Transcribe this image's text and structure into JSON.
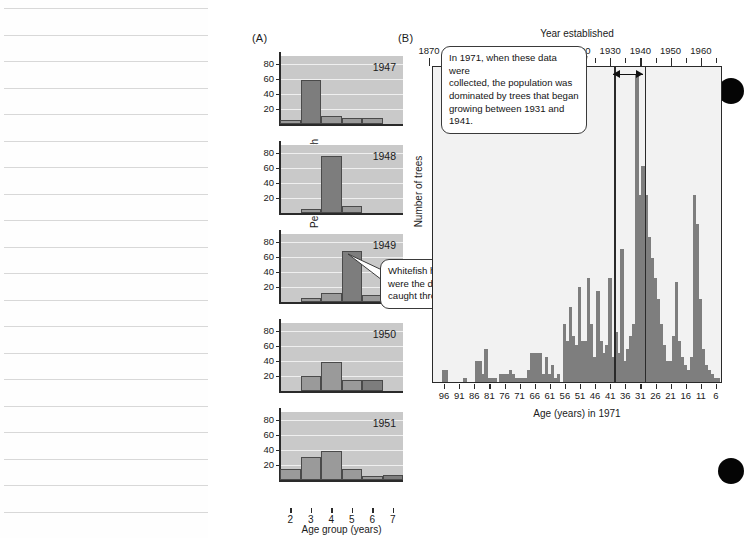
{
  "figure": {
    "panel_a_letter": "(A)",
    "panel_b_letter": "(B)"
  },
  "panel_a": {
    "ylabel": "Percentage of catch",
    "xlabel": "Age group (years)",
    "y_ticks": [
      20,
      40,
      60,
      80
    ],
    "ylim": [
      0,
      90
    ],
    "x_ticks": [
      2,
      3,
      4,
      5,
      6,
      7
    ],
    "callout": "Whitefish hatched in 1944\nwere the dominant age group\ncaught through 1949."
  },
  "panel_b": {
    "top_axis_label": "Year established",
    "ylabel": "Number of trees",
    "xlabel": "Age (years) in 1971",
    "top_ticks": [
      "1870",
      "1880",
      "1890",
      "1900",
      "1910",
      "1920",
      "1930",
      "1940",
      "1950",
      "1960"
    ],
    "bottom_ticks": [
      "96",
      "91",
      "86",
      "81",
      "76",
      "71",
      "66",
      "61",
      "56",
      "51",
      "46",
      "41",
      "36",
      "31",
      "26",
      "21",
      "16",
      "11",
      "6"
    ],
    "callout": "In 1971, when these data were\ncollected, the population was\ndominated by trees that began\ngrowing between 1931 and 1941.",
    "marker_years": [
      1931,
      1941
    ]
  },
  "colors": {
    "bar_fill": "#9a9a9a",
    "bar_fill_dark": "#7d7d7d",
    "panel_a_background": "#c9c9c9",
    "panel_b_background": "#f2f2f2",
    "panel_b_bar": "#7e7e7e",
    "axis": "#2a2a2a",
    "gridline": "#efefef"
  },
  "chart_data": [
    {
      "type": "bar",
      "title": "1947",
      "xlabel": "Age group (years)",
      "ylabel": "Percentage of catch",
      "ylim": [
        0,
        90
      ],
      "categories": [
        2,
        3,
        4,
        5,
        6,
        7
      ],
      "values": [
        5,
        58,
        10,
        8,
        8,
        0
      ],
      "highlight_category": 3,
      "grid": true
    },
    {
      "type": "bar",
      "title": "1948",
      "xlabel": "Age group (years)",
      "ylabel": "Percentage of catch",
      "ylim": [
        0,
        90
      ],
      "categories": [
        2,
        3,
        4,
        5,
        6,
        7
      ],
      "values": [
        0,
        6,
        76,
        9,
        0,
        0
      ],
      "highlight_category": 4,
      "grid": true
    },
    {
      "type": "bar",
      "title": "1949",
      "xlabel": "Age group (years)",
      "ylabel": "Percentage of catch",
      "ylim": [
        0,
        90
      ],
      "categories": [
        2,
        3,
        4,
        5,
        6,
        7
      ],
      "values": [
        0,
        6,
        12,
        67,
        9,
        9
      ],
      "highlight_category": 5,
      "grid": true
    },
    {
      "type": "bar",
      "title": "1950",
      "xlabel": "Age group (years)",
      "ylabel": "Percentage of catch",
      "ylim": [
        0,
        90
      ],
      "categories": [
        2,
        3,
        4,
        5,
        6,
        7
      ],
      "values": [
        0,
        20,
        38,
        14,
        14,
        0
      ],
      "highlight_category": 6,
      "grid": true
    },
    {
      "type": "bar",
      "title": "1951",
      "xlabel": "Age group (years)",
      "ylabel": "Percentage of catch",
      "ylim": [
        0,
        90
      ],
      "categories": [
        2,
        3,
        4,
        5,
        6,
        7
      ],
      "values": [
        14,
        31,
        38,
        14,
        6,
        7
      ],
      "highlight_category": 7,
      "grid": true
    },
    {
      "type": "bar",
      "title": "Tree age distribution in 1971",
      "xlabel": "Age (years) in 1971",
      "ylabel": "Number of trees",
      "secondary_xlabel": "Year established",
      "x": [
        99,
        98,
        97,
        96,
        95,
        94,
        93,
        92,
        91,
        90,
        89,
        88,
        87,
        86,
        85,
        84,
        83,
        82,
        81,
        80,
        79,
        78,
        77,
        76,
        75,
        74,
        73,
        72,
        71,
        70,
        69,
        68,
        67,
        66,
        65,
        64,
        63,
        62,
        61,
        60,
        59,
        58,
        57,
        56,
        55,
        54,
        53,
        52,
        51,
        50,
        49,
        48,
        47,
        46,
        45,
        44,
        43,
        42,
        41,
        40,
        39,
        38,
        37,
        36,
        35,
        34,
        33,
        32,
        31,
        30,
        29,
        28,
        27,
        26,
        25,
        24,
        23,
        22,
        21,
        20,
        19,
        18,
        17,
        16,
        15,
        14,
        13,
        12,
        11,
        10,
        9,
        8,
        7,
        6,
        5
      ],
      "values": [
        0,
        0,
        3,
        3,
        0,
        0,
        0,
        0,
        0,
        1,
        0,
        0,
        0,
        5,
        5,
        2,
        8,
        1,
        1,
        1,
        0,
        2,
        2,
        2,
        3,
        2,
        1,
        1,
        1,
        1,
        3,
        7,
        7,
        7,
        7,
        2,
        6,
        2,
        4,
        1,
        2,
        0,
        14,
        10,
        18,
        11,
        9,
        23,
        10,
        10,
        25,
        14,
        6,
        22,
        10,
        7,
        9,
        25,
        6,
        12,
        7,
        32,
        5,
        8,
        11,
        14,
        74,
        45,
        52,
        45,
        35,
        30,
        25,
        20,
        14,
        9,
        5,
        5,
        11,
        24,
        10,
        6,
        4,
        3,
        6,
        45,
        38,
        20,
        8,
        4,
        3,
        2,
        1,
        1,
        0
      ],
      "grid": false
    }
  ]
}
